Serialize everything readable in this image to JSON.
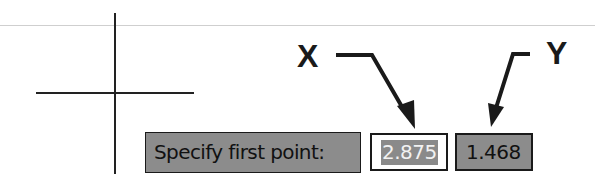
{
  "canvas": {
    "crosshair": "cursor-crosshair"
  },
  "command_prompt": {
    "label": "Specify first point:"
  },
  "inputs": {
    "x_value": "2.875",
    "y_value": "1.468"
  },
  "annotations": {
    "x_label": "X",
    "y_label": "Y"
  },
  "colors": {
    "box_gray": "#8c8c8c",
    "selection_gray": "#8a8a8a",
    "border": "#1a1a1a"
  }
}
